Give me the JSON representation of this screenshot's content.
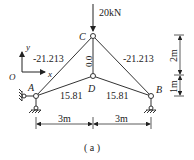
{
  "diagram": {
    "caption": "( a )",
    "load": {
      "label": "20kN",
      "node": "C"
    },
    "axes": {
      "origin": "O",
      "x": "x",
      "y": "y"
    },
    "nodes": [
      {
        "id": "C",
        "label": "C",
        "x": 93,
        "y": 36
      },
      {
        "id": "D",
        "label": "D",
        "x": 93,
        "y": 76
      },
      {
        "id": "A",
        "label": "A",
        "x": 36,
        "y": 96
      },
      {
        "id": "B",
        "label": "B",
        "x": 151,
        "y": 96
      }
    ],
    "members": [
      {
        "from": "A",
        "to": "C",
        "force": "-21.213"
      },
      {
        "from": "C",
        "to": "B",
        "force": "-21.213"
      },
      {
        "from": "C",
        "to": "D",
        "force": "0.0"
      },
      {
        "from": "A",
        "to": "D",
        "force": "15.81"
      },
      {
        "from": "D",
        "to": "B",
        "force": "15.81"
      }
    ],
    "supports": [
      {
        "node": "A",
        "type": "pin-horizontal-and-vertical"
      },
      {
        "node": "B",
        "type": "pin-vertical"
      }
    ],
    "dimensions": {
      "horizontal": [
        "3m",
        "3m"
      ],
      "vertical": [
        "2m",
        "1m"
      ]
    }
  }
}
